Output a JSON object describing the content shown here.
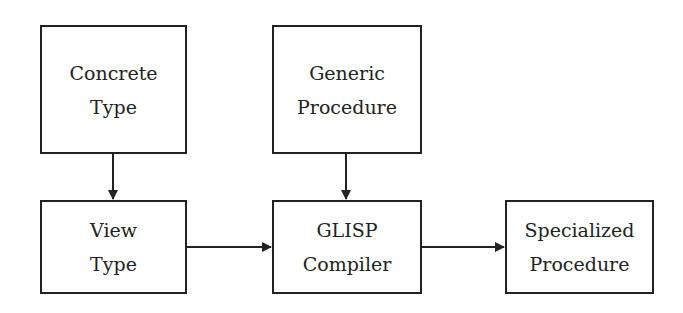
{
  "diagram": {
    "nodes": [
      {
        "id": "concrete-type",
        "lines": [
          "Concrete",
          "Type"
        ]
      },
      {
        "id": "generic-procedure",
        "lines": [
          "Generic",
          "Procedure"
        ]
      },
      {
        "id": "view-type",
        "lines": [
          "View",
          "Type"
        ]
      },
      {
        "id": "glisp-compiler",
        "lines": [
          "GLISP",
          "Compiler"
        ]
      },
      {
        "id": "specialized-procedure",
        "lines": [
          "Specialized",
          "Procedure"
        ]
      }
    ],
    "edges": [
      {
        "from": "concrete-type",
        "to": "view-type"
      },
      {
        "from": "generic-procedure",
        "to": "glisp-compiler"
      },
      {
        "from": "view-type",
        "to": "glisp-compiler"
      },
      {
        "from": "glisp-compiler",
        "to": "specialized-procedure"
      }
    ],
    "colors": {
      "stroke": "#222222",
      "background": "#ffffff"
    }
  }
}
